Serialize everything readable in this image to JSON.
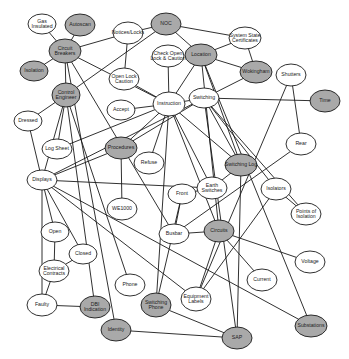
{
  "colors": {
    "highlight_fill": "#a9a9a9",
    "plain_fill": "#ffffff",
    "stroke": "#1a1a1a",
    "text": "#222222"
  },
  "nodes": [
    {
      "id": "gas_insulated",
      "lines": [
        "Gas",
        "Insulated"
      ],
      "x": 42,
      "y": 24,
      "rx": 14,
      "ry": 10,
      "highlight": false
    },
    {
      "id": "autoscan",
      "lines": [
        "Autoscan"
      ],
      "x": 80,
      "y": 25,
      "rx": 15,
      "ry": 11,
      "highlight": true
    },
    {
      "id": "noc",
      "lines": [
        "NOC"
      ],
      "x": 166,
      "y": 24,
      "rx": 15,
      "ry": 11,
      "highlight": true
    },
    {
      "id": "notices_locks",
      "lines": [
        "Notices/Locks"
      ],
      "x": 128,
      "y": 33,
      "rx": 15,
      "ry": 11,
      "highlight": false
    },
    {
      "id": "system_state_certificates",
      "lines": [
        "System State",
        "Certificates"
      ],
      "x": 245,
      "y": 38,
      "rx": 16,
      "ry": 11,
      "highlight": false
    },
    {
      "id": "circuit_breakers",
      "lines": [
        "Circuit",
        "Breakers"
      ],
      "x": 65,
      "y": 51,
      "rx": 16,
      "ry": 12,
      "highlight": true
    },
    {
      "id": "check_open_lock",
      "lines": [
        "Check Open",
        "Lock & Caution"
      ],
      "x": 168,
      "y": 56,
      "rx": 16,
      "ry": 11,
      "highlight": false
    },
    {
      "id": "location",
      "lines": [
        "Location"
      ],
      "x": 201,
      "y": 55,
      "rx": 16,
      "ry": 11,
      "highlight": true
    },
    {
      "id": "isolation",
      "lines": [
        "Isolation"
      ],
      "x": 34,
      "y": 71,
      "rx": 14,
      "ry": 10,
      "highlight": true
    },
    {
      "id": "wokingham",
      "lines": [
        "Wokingham"
      ],
      "x": 256,
      "y": 72,
      "rx": 16,
      "ry": 11,
      "highlight": true
    },
    {
      "id": "shutters",
      "lines": [
        "Shutters"
      ],
      "x": 291,
      "y": 75,
      "rx": 15,
      "ry": 11,
      "highlight": false
    },
    {
      "id": "open_lock_caution",
      "lines": [
        "Open Lock",
        "Caution"
      ],
      "x": 124,
      "y": 79,
      "rx": 15,
      "ry": 11,
      "highlight": false
    },
    {
      "id": "control_engineer",
      "lines": [
        "Control",
        "Engineer"
      ],
      "x": 66,
      "y": 95,
      "rx": 14,
      "ry": 12,
      "highlight": true
    },
    {
      "id": "switching",
      "lines": [
        "Switching"
      ],
      "x": 204,
      "y": 98,
      "rx": 15,
      "ry": 10,
      "highlight": false
    },
    {
      "id": "instruction",
      "lines": [
        "Instruction"
      ],
      "x": 169,
      "y": 104,
      "rx": 16,
      "ry": 12,
      "highlight": false
    },
    {
      "id": "time",
      "lines": [
        "Time"
      ],
      "x": 325,
      "y": 101,
      "rx": 15,
      "ry": 11,
      "highlight": true
    },
    {
      "id": "accept",
      "lines": [
        "Accept"
      ],
      "x": 121,
      "y": 110,
      "rx": 14,
      "ry": 10,
      "highlight": false
    },
    {
      "id": "dressed",
      "lines": [
        "Dressed"
      ],
      "x": 28,
      "y": 121,
      "rx": 14,
      "ry": 10,
      "highlight": false
    },
    {
      "id": "log_sheet",
      "lines": [
        "Log Sheet"
      ],
      "x": 57,
      "y": 149,
      "rx": 15,
      "ry": 10,
      "highlight": false
    },
    {
      "id": "procedures",
      "lines": [
        "Procedures"
      ],
      "x": 121,
      "y": 148,
      "rx": 16,
      "ry": 11,
      "highlight": true
    },
    {
      "id": "rear",
      "lines": [
        "Rear"
      ],
      "x": 301,
      "y": 144,
      "rx": 15,
      "ry": 11,
      "highlight": false
    },
    {
      "id": "refuse",
      "lines": [
        "Refuse"
      ],
      "x": 149,
      "y": 163,
      "rx": 15,
      "ry": 11,
      "highlight": false
    },
    {
      "id": "switching_log",
      "lines": [
        "Switching Log"
      ],
      "x": 241,
      "y": 165,
      "rx": 16,
      "ry": 11,
      "highlight": true
    },
    {
      "id": "displays",
      "lines": [
        "Displays"
      ],
      "x": 42,
      "y": 180,
      "rx": 15,
      "ry": 10,
      "highlight": false
    },
    {
      "id": "earth_switches",
      "lines": [
        "Earth",
        "Switches"
      ],
      "x": 212,
      "y": 188,
      "rx": 15,
      "ry": 11,
      "highlight": false
    },
    {
      "id": "front",
      "lines": [
        "Front"
      ],
      "x": 182,
      "y": 194,
      "rx": 14,
      "ry": 10,
      "highlight": false
    },
    {
      "id": "isolators",
      "lines": [
        "Isolators"
      ],
      "x": 276,
      "y": 189,
      "rx": 15,
      "ry": 11,
      "highlight": false
    },
    {
      "id": "points_of_isolation",
      "lines": [
        "Points of",
        "Isolation"
      ],
      "x": 306,
      "y": 214,
      "rx": 15,
      "ry": 11,
      "highlight": false
    },
    {
      "id": "we1000",
      "lines": [
        "WE1000"
      ],
      "x": 122,
      "y": 209,
      "rx": 15,
      "ry": 11,
      "highlight": false
    },
    {
      "id": "busbar",
      "lines": [
        "Busbar"
      ],
      "x": 174,
      "y": 234,
      "rx": 15,
      "ry": 10,
      "highlight": false
    },
    {
      "id": "open",
      "lines": [
        "Open"
      ],
      "x": 55,
      "y": 232,
      "rx": 14,
      "ry": 10,
      "highlight": false
    },
    {
      "id": "circuits",
      "lines": [
        "Circuits"
      ],
      "x": 219,
      "y": 231,
      "rx": 15,
      "ry": 11,
      "highlight": true
    },
    {
      "id": "closed",
      "lines": [
        "Closed"
      ],
      "x": 83,
      "y": 254,
      "rx": 14,
      "ry": 10,
      "highlight": false
    },
    {
      "id": "voltage",
      "lines": [
        "Voltage"
      ],
      "x": 310,
      "y": 262,
      "rx": 15,
      "ry": 11,
      "highlight": false
    },
    {
      "id": "electrical_contracts",
      "lines": [
        "Electrical",
        "Contracts"
      ],
      "x": 54,
      "y": 271,
      "rx": 15,
      "ry": 11,
      "highlight": false
    },
    {
      "id": "current",
      "lines": [
        "Current"
      ],
      "x": 262,
      "y": 280,
      "rx": 15,
      "ry": 11,
      "highlight": false
    },
    {
      "id": "phone",
      "lines": [
        "Phone"
      ],
      "x": 130,
      "y": 285,
      "rx": 15,
      "ry": 11,
      "highlight": false
    },
    {
      "id": "equipment_labels",
      "lines": [
        "Equipment",
        "Labels"
      ],
      "x": 196,
      "y": 299,
      "rx": 15,
      "ry": 12,
      "highlight": false
    },
    {
      "id": "faulty",
      "lines": [
        "Faulty"
      ],
      "x": 42,
      "y": 305,
      "rx": 15,
      "ry": 11,
      "highlight": false
    },
    {
      "id": "dbi_indication",
      "lines": [
        "DBI",
        "Indication"
      ],
      "x": 95,
      "y": 307,
      "rx": 15,
      "ry": 11,
      "highlight": true
    },
    {
      "id": "switching_phone",
      "lines": [
        "Switching",
        "Phone"
      ],
      "x": 156,
      "y": 305,
      "rx": 15,
      "ry": 12,
      "highlight": true
    },
    {
      "id": "substations",
      "lines": [
        "Substations"
      ],
      "x": 311,
      "y": 326,
      "rx": 16,
      "ry": 11,
      "highlight": true
    },
    {
      "id": "identity",
      "lines": [
        "Identity"
      ],
      "x": 116,
      "y": 330,
      "rx": 15,
      "ry": 11,
      "highlight": true
    },
    {
      "id": "sap",
      "lines": [
        "SAP"
      ],
      "x": 237,
      "y": 338,
      "rx": 15,
      "ry": 11,
      "highlight": true
    }
  ],
  "edges": [
    [
      "gas_insulated",
      "circuit_breakers"
    ],
    [
      "autoscan",
      "circuit_breakers"
    ],
    [
      "isolation",
      "circuit_breakers"
    ],
    [
      "circuit_breakers",
      "notices_locks"
    ],
    [
      "circuit_breakers",
      "control_engineer"
    ],
    [
      "circuit_breakers",
      "instruction"
    ],
    [
      "circuit_breakers",
      "identity"
    ],
    [
      "circuit_breakers",
      "busbar"
    ],
    [
      "noc",
      "notices_locks"
    ],
    [
      "noc",
      "system_state_certificates"
    ],
    [
      "noc",
      "location"
    ],
    [
      "noc",
      "control_engineer"
    ],
    [
      "notices_locks",
      "open_lock_caution"
    ],
    [
      "system_state_certificates",
      "location"
    ],
    [
      "system_state_certificates",
      "wokingham"
    ],
    [
      "location",
      "wokingham"
    ],
    [
      "location",
      "instruction"
    ],
    [
      "location",
      "switching_log"
    ],
    [
      "location",
      "substations"
    ],
    [
      "location",
      "circuits"
    ],
    [
      "check_open_lock",
      "instruction"
    ],
    [
      "wokingham",
      "displays"
    ],
    [
      "shutters",
      "rear"
    ],
    [
      "shutters",
      "equipment_labels"
    ],
    [
      "open_lock_caution",
      "instruction"
    ],
    [
      "control_engineer",
      "log_sheet"
    ],
    [
      "control_engineer",
      "displays"
    ],
    [
      "control_engineer",
      "phone"
    ],
    [
      "control_engineer",
      "dbi_indication"
    ],
    [
      "switching",
      "instruction"
    ],
    [
      "switching",
      "time"
    ],
    [
      "switching",
      "switching_log"
    ],
    [
      "switching",
      "isolators"
    ],
    [
      "switching",
      "points_of_isolation"
    ],
    [
      "switching",
      "sap"
    ],
    [
      "switching",
      "procedures"
    ],
    [
      "instruction",
      "accept"
    ],
    [
      "instruction",
      "refuse"
    ],
    [
      "instruction",
      "earth_switches"
    ],
    [
      "instruction",
      "procedures"
    ],
    [
      "instruction",
      "log_sheet"
    ],
    [
      "instruction",
      "switching_phone"
    ],
    [
      "instruction",
      "switching_log"
    ],
    [
      "instruction",
      "circuits"
    ],
    [
      "dressed",
      "control_engineer"
    ],
    [
      "dressed",
      "displays"
    ],
    [
      "procedures",
      "displays"
    ],
    [
      "procedures",
      "we1000"
    ],
    [
      "rear",
      "busbar"
    ],
    [
      "displays",
      "open"
    ],
    [
      "displays",
      "closed"
    ],
    [
      "displays",
      "faulty"
    ],
    [
      "displays",
      "earth_switches"
    ],
    [
      "displays",
      "equipment_labels"
    ],
    [
      "displays",
      "substations"
    ],
    [
      "front",
      "busbar"
    ],
    [
      "front",
      "switching_phone"
    ],
    [
      "switching_log",
      "earth_switches"
    ],
    [
      "switching_log",
      "sap"
    ],
    [
      "isolators",
      "points_of_isolation"
    ],
    [
      "isolators",
      "equipment_labels"
    ],
    [
      "earth_switches",
      "front"
    ],
    [
      "open",
      "electrical_contracts"
    ],
    [
      "closed",
      "electrical_contracts"
    ],
    [
      "electrical_contracts",
      "faulty"
    ],
    [
      "faulty",
      "dbi_indication"
    ],
    [
      "busbar",
      "circuits"
    ],
    [
      "circuits",
      "voltage"
    ],
    [
      "circuits",
      "current"
    ],
    [
      "circuits",
      "equipment_labels"
    ],
    [
      "switching_phone",
      "sap"
    ],
    [
      "identity",
      "sap"
    ]
  ]
}
